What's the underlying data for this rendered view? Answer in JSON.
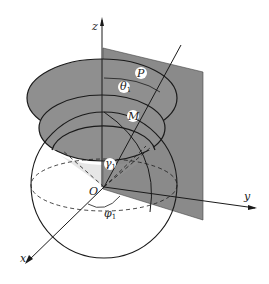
{
  "figure": {
    "colors": {
      "plane_fill": "#8a8a8a",
      "disk_fill": "#8f8f8f",
      "line": "#1a1a1a",
      "label_bg": "#ffffff"
    },
    "labels": {
      "z_axis": "z",
      "y_axis": "y",
      "x_axis": "x",
      "origin": "O",
      "point_p": "P",
      "point_m": "M",
      "theta": "θ",
      "theta_sub": "1",
      "gamma": "γ",
      "gamma_sub": "1",
      "phi": "φ",
      "phi_sub": "1"
    }
  }
}
